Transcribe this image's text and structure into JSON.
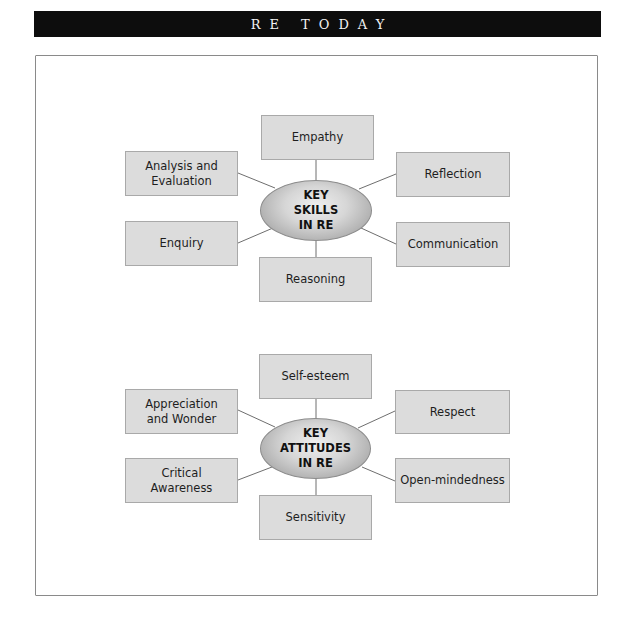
{
  "header": {
    "title": "RE TODAY"
  },
  "diagrams": [
    {
      "center": {
        "lines": [
          "KEY",
          "SKILLS",
          "IN RE"
        ]
      },
      "nodes": {
        "top": "Empathy",
        "upper_left": "Analysis and Evaluation",
        "upper_right": "Reflection",
        "lower_left": "Enquiry",
        "lower_right": "Communication",
        "bottom": "Reasoning"
      }
    },
    {
      "center": {
        "lines": [
          "KEY",
          "ATTITUDES",
          "IN RE"
        ]
      },
      "nodes": {
        "top": "Self-esteem",
        "upper_left": "Appreciation and Wonder",
        "upper_right": "Respect",
        "lower_left": "Critical Awareness",
        "lower_right": "Open-mindedness",
        "bottom": "Sensitivity"
      }
    }
  ],
  "colors": {
    "header_bg": "#0d0d0d",
    "box_fill": "#dcdcdc",
    "box_border": "#a9a9a9",
    "connector": "#6e6e6e"
  }
}
